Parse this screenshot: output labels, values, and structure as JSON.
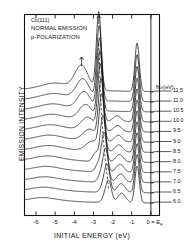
{
  "figure": {
    "header_lines": [
      "Cu(111)",
      "NORMAL EMISSION",
      "p-POLARIZATION"
    ],
    "legend_title": "ħω(eV):",
    "xlabel": "INITIAL ENERGY (eV)",
    "ylabel": "EMISSION INTENSITY",
    "ef_label": "0 = E",
    "ef_sub": "F"
  },
  "chart_data": {
    "type": "line",
    "subtitle": "Stacked energy distribution curves vs photon energy",
    "xlabel": "INITIAL ENERGY (eV)",
    "ylabel": "EMISSION INTENSITY",
    "xlim": [
      -6.6,
      0.45
    ],
    "xticks": [
      -6,
      -5,
      -4,
      -3,
      -2,
      -1,
      0
    ],
    "xticklabels": [
      "-6",
      "-5",
      "-4",
      "-3",
      "-2",
      "-1",
      "0"
    ],
    "ylim": [
      0,
      1
    ],
    "yticks": [],
    "grid": false,
    "legend_position": "right",
    "legend_title": "ħω(eV):",
    "fermi_level_ev": 0,
    "annotations": [
      {
        "label": "arrow",
        "x": -3.62,
        "note": "arrow marking dispersing surface-resonance peak on top curve"
      },
      {
        "label": "arrow",
        "x": -2.72,
        "note": "arrow marking main d-band peak on top curve"
      },
      {
        "label": "dashed-guide",
        "note": "dashed line tracing dispersing peak from -2.6 eV down to -2.2 eV across curves"
      }
    ],
    "peaks_common": [
      {
        "name": "d-band-main",
        "x": -2.72
      },
      {
        "name": "sp-band-near-ef",
        "x": -0.72
      },
      {
        "name": "broad-low-energy",
        "x": -3.62
      }
    ],
    "series": [
      {
        "name": "11.5",
        "photon_energy_ev": 11.5,
        "offset": 0,
        "peaks": [
          {
            "x": -3.62,
            "h": 0.3
          },
          {
            "x": -2.72,
            "h": 1.0
          },
          {
            "x": -0.72,
            "h": 0.62
          }
        ]
      },
      {
        "name": "11.0",
        "photon_energy_ev": 11.0,
        "offset": 1,
        "peaks": [
          {
            "x": -3.55,
            "h": 0.26
          },
          {
            "x": -2.7,
            "h": 0.95
          },
          {
            "x": -0.72,
            "h": 0.6
          }
        ]
      },
      {
        "name": "10.5",
        "photon_energy_ev": 10.5,
        "offset": 2,
        "peaks": [
          {
            "x": -3.48,
            "h": 0.23
          },
          {
            "x": -2.68,
            "h": 0.92
          },
          {
            "x": -0.72,
            "h": 0.58
          }
        ]
      },
      {
        "name": "10.0",
        "photon_energy_ev": 10.0,
        "offset": 3,
        "peaks": [
          {
            "x": -3.4,
            "h": 0.2
          },
          {
            "x": -2.66,
            "h": 0.88
          },
          {
            "x": -0.72,
            "h": 0.56
          }
        ]
      },
      {
        "name": "9.5",
        "photon_energy_ev": 9.5,
        "offset": 4,
        "peaks": [
          {
            "x": -3.3,
            "h": 0.17
          },
          {
            "x": -2.64,
            "h": 0.84
          },
          {
            "x": -0.72,
            "h": 0.55
          }
        ]
      },
      {
        "name": "9.0",
        "photon_energy_ev": 9.0,
        "offset": 5,
        "peaks": [
          {
            "x": -3.2,
            "h": 0.15
          },
          {
            "x": -2.6,
            "h": 0.78
          },
          {
            "x": -0.72,
            "h": 0.54
          }
        ]
      },
      {
        "name": "8.5",
        "photon_energy_ev": 8.5,
        "offset": 6,
        "peaks": [
          {
            "x": -3.05,
            "h": 0.13
          },
          {
            "x": -2.56,
            "h": 0.7
          },
          {
            "x": -0.72,
            "h": 0.53
          }
        ]
      },
      {
        "name": "8.0",
        "photon_energy_ev": 8.0,
        "offset": 7,
        "peaks": [
          {
            "x": -2.9,
            "h": 0.11
          },
          {
            "x": -2.5,
            "h": 0.6
          },
          {
            "x": -0.72,
            "h": 0.52
          }
        ]
      },
      {
        "name": "7.5",
        "photon_energy_ev": 7.5,
        "offset": 8,
        "peaks": [
          {
            "x": -2.75,
            "h": 0.1
          },
          {
            "x": -2.44,
            "h": 0.5
          },
          {
            "x": -0.72,
            "h": 0.51
          }
        ]
      },
      {
        "name": "7.0",
        "photon_energy_ev": 7.0,
        "offset": 9,
        "peaks": [
          {
            "x": -2.62,
            "h": 0.09
          },
          {
            "x": -2.36,
            "h": 0.42
          },
          {
            "x": -0.72,
            "h": 0.5
          }
        ]
      },
      {
        "name": "6.5",
        "photon_energy_ev": 6.5,
        "offset": 10,
        "peaks": [
          {
            "x": -2.5,
            "h": 0.08
          },
          {
            "x": -2.28,
            "h": 0.34
          },
          {
            "x": -0.72,
            "h": 0.49
          }
        ]
      },
      {
        "name": "6.0",
        "photon_energy_ev": 6.0,
        "offset": 11,
        "peaks": [
          {
            "x": -2.4,
            "h": 0.07
          },
          {
            "x": -2.2,
            "h": 0.26
          },
          {
            "x": -0.72,
            "h": 0.47
          }
        ]
      }
    ]
  }
}
